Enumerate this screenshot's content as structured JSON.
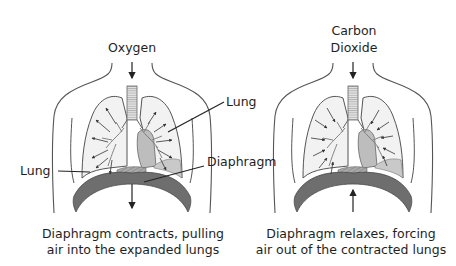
{
  "diagram": {
    "inhale": {
      "gas_label": "Oxygen",
      "labels": {
        "lung_right": "Lung",
        "lung_left": "Lung",
        "diaphragm": "Diaphragm"
      },
      "caption_line1": "Diaphragm contracts, pulling",
      "caption_line2": "air into the expanded lungs",
      "airflow": "outward",
      "diaphragm_motion": "down"
    },
    "exhale": {
      "gas_label_line1": "Carbon",
      "gas_label_line2": "Dioxide",
      "caption_line1": "Diaphragm relaxes, forcing",
      "caption_line2": "air out of the contracted lungs",
      "airflow": "inward",
      "diaphragm_motion": "up"
    },
    "colors": {
      "outline": "#555555",
      "lung_fill": "#f2f2f2",
      "heart_fill": "#bdbdbd",
      "diaphragm_fill": "#6e6e6e",
      "arrow": "#222222"
    }
  }
}
